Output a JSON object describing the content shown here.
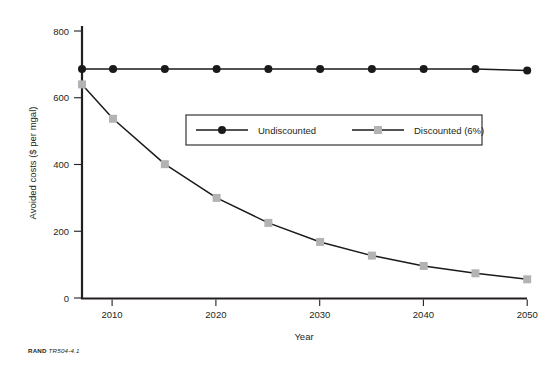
{
  "figure": {
    "source_brand": "RAND",
    "figure_id": "TR504-4.1"
  },
  "chart_data": {
    "type": "line",
    "title": "",
    "xlabel": "Year",
    "ylabel": "Avoided costs ($ per mgal)",
    "x": [
      2007,
      2010,
      2015,
      2020,
      2025,
      2030,
      2035,
      2040,
      2045,
      2050
    ],
    "xticks": [
      2010,
      2020,
      2030,
      2040,
      2050
    ],
    "xtick_labels": [
      "2010",
      "2020",
      "2030",
      "2040",
      "2050"
    ],
    "yticks": [
      0,
      200,
      400,
      600,
      800
    ],
    "ytick_labels": [
      "0",
      "200",
      "400",
      "600",
      "800"
    ],
    "xlim": [
      2007,
      2050
    ],
    "ylim": [
      0,
      800
    ],
    "grid": false,
    "legend_position": "center",
    "series": [
      {
        "name": "Undiscounted",
        "color": "#1a1a1a",
        "marker": "circle",
        "values": [
          686,
          686,
          686,
          686,
          686,
          686,
          686,
          686,
          686,
          682
        ]
      },
      {
        "name": "Discounted (6%)",
        "color": "#b3b3b3",
        "marker": "square",
        "values": [
          640,
          537,
          401,
          300,
          225,
          168,
          127,
          96,
          74,
          56
        ]
      }
    ]
  },
  "legend": {
    "entries": [
      {
        "label": "Undiscounted"
      },
      {
        "label": "Discounted (6%)"
      }
    ]
  }
}
